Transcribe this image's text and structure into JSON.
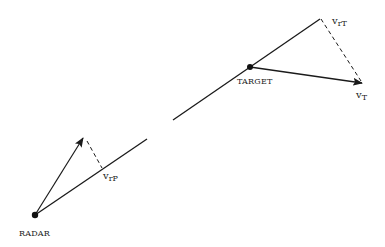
{
  "diagram": {
    "type": "radar-target velocity geometry",
    "colors": {
      "stroke": "#1a1a1a",
      "text": "#222222",
      "background": "#ffffff"
    },
    "labels": {
      "radar": "RADAR",
      "target": "TARGET",
      "v_rP": {
        "base": "v",
        "sub": "rP"
      },
      "v_rT": {
        "base": "v",
        "sub": "rT"
      },
      "v_T": {
        "base": "v",
        "sub": "T"
      }
    },
    "points": {
      "radar": [
        35,
        215
      ],
      "target": [
        250,
        67
      ]
    },
    "elements": [
      "line-of-sight from RADAR to TARGET (broken segment in middle) extending to v_rT",
      "radial component v_rT along line of sight beyond target",
      "target velocity vector v_T (arrow)",
      "dashed projection from v_T tip to v_rT",
      "velocity vector at radar (arrow) with dashed projection to v_rP on line of sight"
    ]
  }
}
